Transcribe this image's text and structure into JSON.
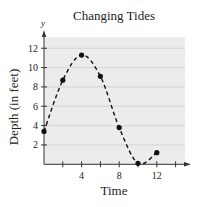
{
  "chart_data": {
    "type": "line",
    "title": "Changing Tides",
    "xlabel": "Time",
    "ylabel": "Depth (in feet)",
    "y_var_label": "y",
    "x": [
      0,
      2,
      4,
      6,
      8,
      10,
      12
    ],
    "series": [
      {
        "name": "Depth",
        "values": [
          3.4,
          8.7,
          11.3,
          9.1,
          3.8,
          0.1,
          1.2
        ],
        "style": "dashed smooth curve with point markers"
      }
    ],
    "x_ticks": [
      2,
      4,
      6,
      8,
      10,
      12,
      14
    ],
    "x_tick_labels": [
      "",
      "4",
      "",
      "8",
      "",
      "12",
      ""
    ],
    "y_ticks": [
      2,
      4,
      6,
      8,
      10,
      12
    ],
    "y_tick_labels": [
      "2",
      "4",
      "6",
      "8",
      "10",
      "12"
    ],
    "xlim": [
      0,
      15
    ],
    "ylim": [
      0,
      13.5
    ],
    "grid": "horizontal",
    "legend": "none"
  },
  "colors": {
    "plot_background": "#ececec",
    "gridline": "#cfcfcf",
    "axis": "#333333",
    "curve": "#111111",
    "marker": "#111111"
  }
}
